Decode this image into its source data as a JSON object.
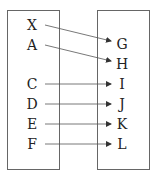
{
  "diagram": {
    "type": "mapping",
    "domain_set": {
      "elements": [
        {
          "label": "X",
          "y": 25
        },
        {
          "label": "A",
          "y": 45
        },
        {
          "label": "C",
          "y": 84
        },
        {
          "label": "D",
          "y": 104
        },
        {
          "label": "E",
          "y": 124
        },
        {
          "label": "F",
          "y": 144
        }
      ]
    },
    "codomain_set": {
      "elements": [
        {
          "label": "G",
          "y": 44
        },
        {
          "label": "H",
          "y": 64
        },
        {
          "label": "I",
          "y": 84
        },
        {
          "label": "J",
          "y": 104
        },
        {
          "label": "K",
          "y": 124
        },
        {
          "label": "L",
          "y": 144
        }
      ]
    },
    "arrows": [
      {
        "from": "X",
        "to": "G"
      },
      {
        "from": "A",
        "to": "H"
      },
      {
        "from": "C",
        "to": "I"
      },
      {
        "from": "D",
        "to": "J"
      },
      {
        "from": "E",
        "to": "K"
      },
      {
        "from": "F",
        "to": "L"
      }
    ],
    "colors": {
      "stroke": "#555555",
      "text": "#222222"
    }
  }
}
